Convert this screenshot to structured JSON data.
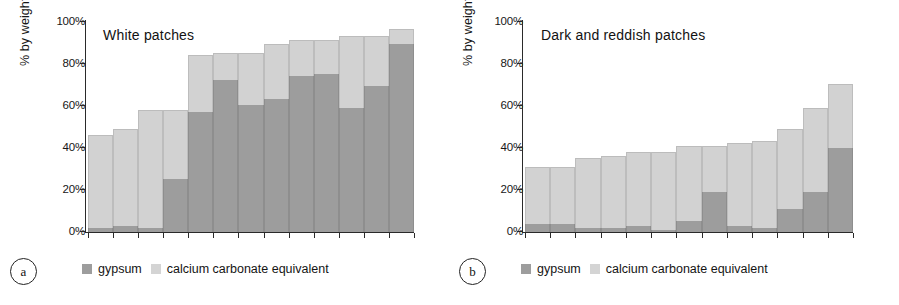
{
  "figure": {
    "panels": [
      {
        "tag": "a",
        "title": "White patches",
        "ylabel": "% by weight",
        "ytick_labels": [
          "0%",
          "20%",
          "40%",
          "60%",
          "80%",
          "100%"
        ],
        "legend": [
          {
            "label": "gypsum",
            "color": "#9d9d9d",
            "key": "gypsum-swatch"
          },
          {
            "label": "calcium carbonate equivalent",
            "color": "#d4d4d4",
            "key": "ccq-swatch"
          }
        ]
      },
      {
        "tag": "b",
        "title": "Dark and reddish patches",
        "ylabel": "% by weight",
        "ytick_labels": [
          "0%",
          "20%",
          "40%",
          "60%",
          "80%",
          "100%"
        ],
        "legend": [
          {
            "label": "gypsum",
            "color": "#9d9d9d",
            "key": "gypsum-swatch"
          },
          {
            "label": "calcium carbonate equivalent",
            "color": "#d4d4d4",
            "key": "ccq-swatch"
          }
        ]
      }
    ]
  },
  "chart_data": [
    {
      "type": "bar",
      "subtype": "stacked-vertical",
      "panel": "a",
      "title": "White patches",
      "xlabel": "",
      "ylabel": "% by weight",
      "ylim": [
        0,
        100
      ],
      "yticks": [
        0,
        20,
        40,
        60,
        80,
        100
      ],
      "ytick_labels": [
        "0%",
        "20%",
        "40%",
        "60%",
        "80%",
        "100%"
      ],
      "grid": false,
      "legend_position": "below-plot",
      "categories": [
        "1",
        "2",
        "3",
        "4",
        "5",
        "6",
        "7",
        "8",
        "9",
        "10",
        "11",
        "12",
        "13"
      ],
      "series": [
        {
          "name": "gypsum",
          "color": "#9d9d9d",
          "values": [
            2,
            3,
            2,
            25,
            57,
            72,
            60,
            63,
            74,
            75,
            59,
            69,
            89
          ]
        },
        {
          "name": "calcium carbonate equivalent",
          "color": "#d4d4d4",
          "values": [
            44,
            46,
            56,
            33,
            27,
            13,
            25,
            26,
            17,
            16,
            34,
            24,
            7
          ]
        }
      ],
      "totals": [
        46,
        49,
        58,
        58,
        84,
        85,
        85,
        89,
        91,
        91,
        93,
        93,
        96
      ]
    },
    {
      "type": "bar",
      "subtype": "stacked-vertical",
      "panel": "b",
      "title": "Dark and reddish patches",
      "xlabel": "",
      "ylabel": "% by weight",
      "ylim": [
        0,
        100
      ],
      "yticks": [
        0,
        20,
        40,
        60,
        80,
        100
      ],
      "ytick_labels": [
        "0%",
        "20%",
        "40%",
        "60%",
        "80%",
        "100%"
      ],
      "grid": false,
      "legend_position": "below-plot",
      "categories": [
        "1",
        "2",
        "3",
        "4",
        "5",
        "6",
        "7",
        "8",
        "9",
        "10",
        "11",
        "12",
        "13"
      ],
      "series": [
        {
          "name": "gypsum",
          "color": "#9d9d9d",
          "values": [
            4,
            4,
            2,
            2,
            3,
            1,
            5,
            19,
            3,
            2,
            11,
            19,
            40
          ]
        },
        {
          "name": "calcium carbonate equivalent",
          "color": "#d4d4d4",
          "values": [
            27,
            27,
            33,
            34,
            35,
            37,
            36,
            22,
            39,
            41,
            38,
            40,
            30
          ]
        }
      ],
      "totals": [
        31,
        31,
        35,
        36,
        38,
        38,
        41,
        41,
        42,
        43,
        49,
        59,
        70
      ]
    }
  ]
}
